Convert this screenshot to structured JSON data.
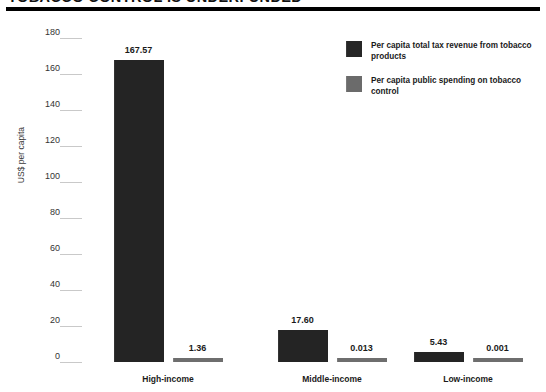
{
  "title": "TOBACCO CONTROL IS UNDERFUNDED",
  "chart_data": {
    "type": "bar",
    "title": "TOBACCO CONTROL IS UNDERFUNDED",
    "xlabel": "",
    "ylabel": "US$ per capita",
    "ylim": [
      0,
      180
    ],
    "yticks": [
      180,
      160,
      140,
      120,
      100,
      80,
      60,
      40,
      20,
      0
    ],
    "ytick_labels": [
      "180",
      "160",
      "140",
      "120",
      "100",
      "80",
      "60",
      "40",
      "20",
      "0"
    ],
    "grid": true,
    "legend_position": "top-right",
    "categories": [
      "High-income",
      "Middle-income",
      "Low-income"
    ],
    "series": [
      {
        "name": "Per capita total tax revenue from tobacco products",
        "color": "#242424",
        "values": [
          167.57,
          17.6,
          5.43
        ],
        "labels": [
          "167.57",
          "17.60",
          "5.43"
        ]
      },
      {
        "name": "Per capita public spending on tobacco control",
        "color": "#6e6e6e",
        "values": [
          1.36,
          0.013,
          0.001
        ],
        "labels": [
          "1.36",
          "0.013",
          "0.001"
        ]
      }
    ]
  },
  "legend": {
    "items": [
      {
        "label": "Per capita total tax revenue from tobacco products",
        "swatch": "#262626"
      },
      {
        "label": "Per capita public spending on tobacco control",
        "swatch": "#6b6b6b"
      }
    ]
  }
}
